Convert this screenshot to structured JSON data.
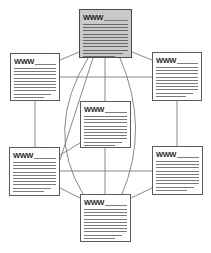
{
  "diagram": {
    "type": "node-link-network",
    "canvas": {
      "width": 211,
      "height": 253,
      "background": "#ffffff"
    },
    "node_label": "WWW",
    "stroke_color": "#5a5a5a",
    "line_color": "#7a7a7a",
    "shaded_fill": "#c9c9c9",
    "plain_fill": "#ffffff",
    "nodes": [
      {
        "id": "node-top",
        "name": "document-node-top",
        "label": "WWW",
        "shaded": true,
        "x": 79,
        "y": 9,
        "w": 53,
        "h": 49,
        "line_count": 11
      },
      {
        "id": "node-left-upper",
        "name": "document-node-left-upper",
        "label": "WWW",
        "shaded": false,
        "x": 10,
        "y": 53,
        "w": 50,
        "h": 48,
        "line_count": 10
      },
      {
        "id": "node-right-upper",
        "name": "document-node-right-upper",
        "label": "WWW",
        "shaded": false,
        "x": 152,
        "y": 52,
        "w": 50,
        "h": 49,
        "line_count": 10
      },
      {
        "id": "node-center",
        "name": "document-node-center",
        "label": "WWW",
        "shaded": false,
        "x": 80,
        "y": 101,
        "w": 51,
        "h": 47,
        "line_count": 10
      },
      {
        "id": "node-left-lower",
        "name": "document-node-left-lower",
        "label": "WWW",
        "shaded": false,
        "x": 9,
        "y": 147,
        "w": 51,
        "h": 49,
        "line_count": 10
      },
      {
        "id": "node-right-lower",
        "name": "document-node-right-lower",
        "label": "WWW",
        "shaded": false,
        "x": 152,
        "y": 146,
        "w": 51,
        "h": 49,
        "line_count": 10
      },
      {
        "id": "node-bottom",
        "name": "document-node-bottom",
        "label": "WWW",
        "shaded": false,
        "x": 80,
        "y": 194,
        "w": 51,
        "h": 48,
        "line_count": 10
      }
    ],
    "edges": [
      {
        "name": "edge-top-to-left-upper",
        "kind": "line",
        "x1": 79,
        "y1": 52,
        "x2": 60,
        "y2": 60
      },
      {
        "name": "edge-top-to-right-upper",
        "kind": "line",
        "x1": 132,
        "y1": 52,
        "x2": 152,
        "y2": 60
      },
      {
        "name": "edge-top-to-center",
        "kind": "line",
        "x1": 105,
        "y1": 58,
        "x2": 105,
        "y2": 101
      },
      {
        "name": "edge-top-to-left-lower",
        "kind": "line",
        "x1": 93,
        "y1": 58,
        "x2": 60,
        "y2": 160
      },
      {
        "name": "edge-top-to-bottom-curve-left",
        "kind": "curve",
        "x1": 88,
        "y1": 58,
        "cx": 44,
        "cy": 130,
        "x2": 83,
        "y2": 194
      },
      {
        "name": "edge-top-to-bottom-curve-right",
        "kind": "curve",
        "x1": 120,
        "y1": 58,
        "cx": 150,
        "cy": 128,
        "x2": 122,
        "y2": 194
      },
      {
        "name": "edge-left-upper-to-right-upper",
        "kind": "line",
        "x1": 60,
        "y1": 77,
        "x2": 152,
        "y2": 77
      },
      {
        "name": "edge-left-upper-to-left-lower",
        "kind": "line",
        "x1": 35,
        "y1": 101,
        "x2": 35,
        "y2": 147
      },
      {
        "name": "edge-right-upper-to-right-lower",
        "kind": "line",
        "x1": 177,
        "y1": 101,
        "x2": 177,
        "y2": 146
      },
      {
        "name": "edge-left-lower-to-right-lower",
        "kind": "line",
        "x1": 60,
        "y1": 171,
        "x2": 152,
        "y2": 171
      },
      {
        "name": "edge-center-to-left-lower",
        "kind": "line",
        "x1": 80,
        "y1": 143,
        "x2": 60,
        "y2": 155
      },
      {
        "name": "edge-center-to-bottom",
        "kind": "line",
        "x1": 105,
        "y1": 148,
        "x2": 105,
        "y2": 194
      },
      {
        "name": "edge-bottom-to-left-lower",
        "kind": "line",
        "x1": 80,
        "y1": 198,
        "x2": 60,
        "y2": 188
      },
      {
        "name": "edge-bottom-to-right-lower",
        "kind": "line",
        "x1": 131,
        "y1": 198,
        "x2": 152,
        "y2": 188
      }
    ]
  }
}
